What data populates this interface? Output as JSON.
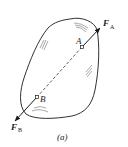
{
  "diagram": {
    "caption": "(a)",
    "points": [
      {
        "name": "A",
        "x": 82,
        "y": 47
      },
      {
        "name": "B",
        "x": 37,
        "y": 97
      }
    ],
    "forces": [
      {
        "symbol": "F",
        "subscript": "A",
        "at": "A"
      },
      {
        "symbol": "F",
        "subscript": "B",
        "at": "B"
      }
    ],
    "colors": {
      "stroke": "#1a1a1a",
      "background": "#ffffff"
    }
  }
}
